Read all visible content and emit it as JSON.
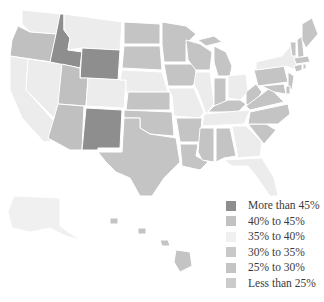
{
  "title_partial": "",
  "legend": {
    "items": [
      {
        "label": "More than 45%",
        "color": "#8e8e8e"
      },
      {
        "label": "40% to 45%",
        "color": "#c2c2c2"
      },
      {
        "label": "35% to 40%",
        "color": "#f0f0f0"
      },
      {
        "label": "30% to 35%",
        "color": "#c8c8c8"
      },
      {
        "label": "25% to 30%",
        "color": "#c4c4c4"
      },
      {
        "label": "Less than 25%",
        "color": "#cbcbcb"
      }
    ]
  },
  "footnote": "Source: Data from ... (text cut off)",
  "colors": {
    "dark": "#8e8e8e",
    "mid": "#c4c4c4",
    "light": "#ececec",
    "border": "#ffffff"
  },
  "states": {
    "dark": [
      "Idaho",
      "Wyoming",
      "New Mexico"
    ],
    "light": [
      "Washington",
      "California",
      "Nevada",
      "Montana",
      "Colorado",
      "Nebraska",
      "Missouri",
      "Illinois",
      "Ohio",
      "Tennessee",
      "Georgia",
      "Florida",
      "New York",
      "Alaska"
    ],
    "mid": [
      "Oregon",
      "Utah",
      "Arizona",
      "North Dakota",
      "South Dakota",
      "Kansas",
      "Oklahoma",
      "Texas",
      "Minnesota",
      "Iowa",
      "Wisconsin",
      "Michigan",
      "Indiana",
      "Kentucky",
      "West Virginia",
      "Virginia",
      "North Carolina",
      "South Carolina",
      "Alabama",
      "Mississippi",
      "Louisiana",
      "Arkansas",
      "Pennsylvania",
      "New Jersey",
      "Maryland",
      "Delaware",
      "Vermont",
      "New Hampshire",
      "Maine",
      "Massachusetts",
      "Connecticut",
      "Rhode Island",
      "Hawaii"
    ]
  }
}
